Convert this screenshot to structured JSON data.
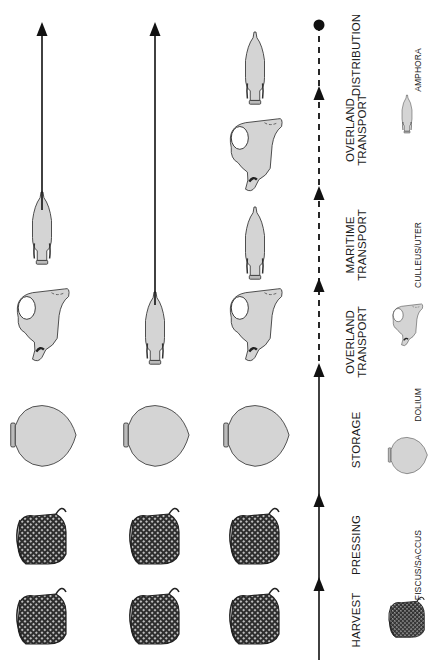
{
  "diagram": {
    "type": "process-flow",
    "orientation": "rotated-90-ccw",
    "colors": {
      "line": "#111111",
      "vessel_fill": "#d4d4d4",
      "vessel_stroke": "#333333",
      "wicker_fill": "#3a3a3a",
      "background": "#ffffff"
    },
    "stages": [
      {
        "id": "harvest",
        "label_lines": [
          "HARVEST"
        ],
        "y": 620
      },
      {
        "id": "pressing",
        "label_lines": [
          "PRESSING"
        ],
        "y": 545
      },
      {
        "id": "storage",
        "label_lines": [
          "STORAGE"
        ],
        "y": 440
      },
      {
        "id": "overland1",
        "label_lines": [
          "OVERLAND",
          "TRANSPORT"
        ],
        "y": 342
      },
      {
        "id": "maritime",
        "label_lines": [
          "MARITIME",
          "TRANSPORT"
        ],
        "y": 245
      },
      {
        "id": "overland2",
        "label_lines": [
          "OVERLAND",
          "TRANSPORT"
        ],
        "y": 130
      },
      {
        "id": "distribution",
        "label_lines": [
          "DISTRIBUTION"
        ],
        "y": 55
      }
    ],
    "timeline": {
      "x": 319,
      "solid_from_y": 660,
      "solid_to_y": 372,
      "dashed_to_y": 25,
      "arrowheads_y": [
        586,
        502,
        372,
        287,
        195,
        95
      ],
      "end_dot_y": 25
    },
    "legend": [
      {
        "vessel": "fiscus",
        "label": "FISCUS/SACCUS",
        "icon_y": 620,
        "label_y": 565
      },
      {
        "vessel": "dolium",
        "label": "DOLIUM",
        "icon_y": 455,
        "label_y": 405
      },
      {
        "vessel": "culleus",
        "label": "CULLEUS/UTER",
        "icon_y": 325,
        "label_y": 255
      },
      {
        "vessel": "amphora",
        "label": "AMPHORA",
        "icon_y": 115,
        "label_y": 70
      }
    ],
    "rows": [
      {
        "name": "row-left",
        "x": 42,
        "items": [
          {
            "vessel": "fiscus",
            "y": 620
          },
          {
            "vessel": "fiscus",
            "y": 540
          },
          {
            "vessel": "dolium",
            "y": 435
          },
          {
            "vessel": "culleus",
            "y": 325
          },
          {
            "vessel": "amphora",
            "y": 230
          }
        ],
        "arrow": {
          "from_y": 210,
          "to_y": 25
        }
      },
      {
        "name": "row-middle",
        "x": 155,
        "items": [
          {
            "vessel": "fiscus",
            "y": 620
          },
          {
            "vessel": "fiscus",
            "y": 540
          },
          {
            "vessel": "dolium",
            "y": 435
          },
          {
            "vessel": "amphora",
            "y": 330
          }
        ],
        "arrow": {
          "from_y": 305,
          "to_y": 25
        }
      },
      {
        "name": "row-right",
        "x": 255,
        "items": [
          {
            "vessel": "fiscus",
            "y": 620
          },
          {
            "vessel": "fiscus",
            "y": 540
          },
          {
            "vessel": "dolium",
            "y": 435
          },
          {
            "vessel": "culleus",
            "y": 325
          },
          {
            "vessel": "amphora",
            "y": 245
          },
          {
            "vessel": "culleus",
            "y": 155
          },
          {
            "vessel": "amphora",
            "y": 70
          }
        ],
        "arrow": null
      }
    ]
  }
}
